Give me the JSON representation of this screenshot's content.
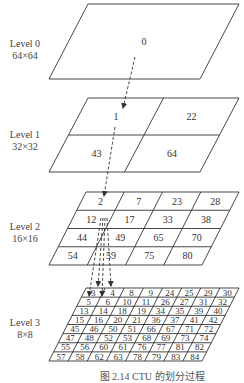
{
  "figure": {
    "caption": "图 2.14   CTU 的划分过程",
    "line_color": "#333333",
    "arrow_color": "#333333",
    "levels": [
      {
        "name": "Level 0",
        "size": "64×64",
        "grid": 1,
        "cells": [
          [
            "0"
          ]
        ]
      },
      {
        "name": "Level 1",
        "size": "32×32",
        "grid": 2,
        "cells": [
          [
            "1",
            "22"
          ],
          [
            "43",
            "64"
          ]
        ]
      },
      {
        "name": "Level 2",
        "size": "16×16",
        "grid": 4,
        "cells": [
          [
            "2",
            "7",
            "23",
            "28"
          ],
          [
            "12",
            "17",
            "33",
            "38"
          ],
          [
            "44",
            "49",
            "65",
            "70"
          ],
          [
            "54",
            "59",
            "75",
            "80"
          ]
        ]
      },
      {
        "name": "Level 3",
        "size": "8×8",
        "grid": 8,
        "cells": [
          [
            "3",
            "4",
            "8",
            "9",
            "24",
            "25",
            "29",
            "30"
          ],
          [
            "5",
            "6",
            "10",
            "11",
            "26",
            "27",
            "31",
            "32"
          ],
          [
            "13",
            "14",
            "18",
            "19",
            "34",
            "35",
            "39",
            "40"
          ],
          [
            "15",
            "16",
            "20",
            "21",
            "36",
            "37",
            "41",
            "42"
          ],
          [
            "45",
            "46",
            "50",
            "51",
            "66",
            "67",
            "71",
            "72"
          ],
          [
            "47",
            "48",
            "52",
            "53",
            "68",
            "69",
            "73",
            "74"
          ],
          [
            "55",
            "56",
            "60",
            "61",
            "76",
            "77",
            "81",
            "82"
          ],
          [
            "57",
            "58",
            "62",
            "63",
            "78",
            "79",
            "83",
            "84"
          ]
        ]
      }
    ]
  }
}
